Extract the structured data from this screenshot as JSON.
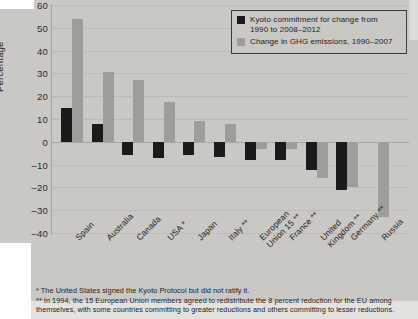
{
  "chart_data": {
    "type": "bar",
    "title": "",
    "xlabel": "",
    "ylabel": "Percentage",
    "ylim": [
      -40,
      60
    ],
    "yticks": [
      60,
      50,
      40,
      30,
      20,
      10,
      0,
      -10,
      -20,
      -30,
      -40
    ],
    "grid": true,
    "legend_position": "top-right",
    "categories": [
      "Spain",
      "Australia",
      "Canada",
      "USA *",
      "Japan",
      "Italy **",
      "European\nUnion 15 **",
      "France **",
      "United\nKingdom **",
      "Germany **",
      "Russia"
    ],
    "series": [
      {
        "name": "Kyoto commitment for change from 1990 to 2008–2012",
        "color": "#1b1b1b",
        "values": [
          15,
          8,
          -6,
          -7,
          -6,
          -6.5,
          -8,
          -8,
          -12.5,
          -21,
          null
        ]
      },
      {
        "name": "Change in GHG emissions, 1990–2007",
        "color": "#9e9d99",
        "values": [
          54,
          30.5,
          27,
          17.5,
          9,
          8,
          -3,
          -3,
          -16,
          -20,
          -33
        ]
      }
    ]
  },
  "legend": {
    "items": [
      {
        "swatch": "black",
        "line1": "Kyoto commitment for change from",
        "line2": "1990 to 2008–2012"
      },
      {
        "swatch": "grey",
        "line1": "Change in GHG emissions, 1990–2007",
        "line2": ""
      }
    ]
  },
  "axis": {
    "y_title": "Percentage",
    "y_ticks": [
      "60",
      "50",
      "40",
      "30",
      "20",
      "10",
      "0",
      "–10",
      "–20",
      "–30",
      "–40"
    ]
  },
  "footnotes": {
    "line1": "* The United States signed the Kyoto Protocol but did not ratify it.",
    "line2": "** In 1994, the 15 European Union members agreed to redistribute the 8 percent reduction for the EU among",
    "line3": "themselves, with some countries committing to greater reductions and others committing to lesser reductions."
  },
  "colors": {
    "page_background": "#c9c8c4",
    "kyoto_bar": "#1b1b1b",
    "ghg_bar": "#9e9d99",
    "gridline": "#bcbbb7",
    "text": "#232323"
  }
}
